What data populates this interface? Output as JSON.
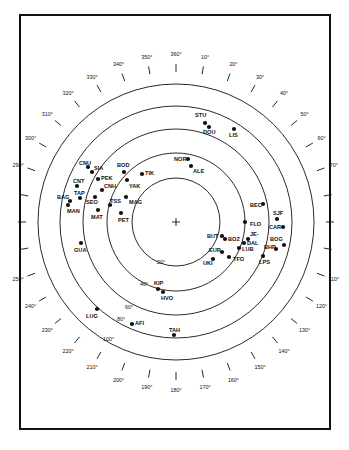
{
  "diagram": {
    "type": "polar-sky-plot",
    "center": [
      176,
      222
    ],
    "center_marker": "+",
    "rings": [
      {
        "label": "20°",
        "radius": 44
      },
      {
        "label": "40°",
        "radius": 69
      },
      {
        "label": "60°",
        "radius": 93
      },
      {
        "label": "80°",
        "radius": 116
      },
      {
        "label": "100°",
        "radius": 138
      }
    ],
    "azimuth_labels": [
      "360°",
      "10°",
      "20°",
      "30°",
      "40°",
      "50°",
      "60°",
      "70°",
      "",
      "",
      "",
      "110°",
      "120°",
      "130°",
      "140°",
      "150°",
      "160°",
      "170°",
      "180°",
      "190°",
      "200°",
      "210°",
      "220°",
      "230°",
      "240°",
      "250°",
      "",
      "",
      "",
      "290°",
      "300°",
      "310°",
      "320°",
      "330°",
      "340°",
      "350°"
    ],
    "stations": [
      {
        "code": "STU",
        "x": 205,
        "y": 123,
        "lx": 195,
        "ly": 117
      },
      {
        "code": "DOU",
        "x": 209,
        "y": 127,
        "lx": 203,
        "ly": 134
      },
      {
        "code": "LIS",
        "x": 234,
        "y": 129,
        "lx": 229,
        "ly": 137
      },
      {
        "code": "NOR",
        "x": 188,
        "y": 159,
        "lx": 174,
        "ly": 161
      },
      {
        "code": "ALE",
        "x": 191,
        "y": 166,
        "lx": 193,
        "ly": 173
      },
      {
        "code": "CNU",
        "x": 88,
        "y": 167,
        "lx": 79,
        "ly": 165
      },
      {
        "code": "SIA",
        "x": 92,
        "y": 172,
        "lx": 94,
        "ly": 170
      },
      {
        "code": "BOD",
        "x": 124,
        "y": 172,
        "lx": 117,
        "ly": 167
      },
      {
        "code": "TIK",
        "x": 142,
        "y": 174,
        "lx": 145,
        "ly": 175
      },
      {
        "code": "PEK",
        "x": 98,
        "y": 179,
        "lx": 101,
        "ly": 180
      },
      {
        "code": "YAK",
        "x": 127,
        "y": 180,
        "lx": 129,
        "ly": 188
      },
      {
        "code": "CNT",
        "x": 77,
        "y": 186,
        "lx": 73,
        "ly": 183
      },
      {
        "code": "CNH",
        "x": 102,
        "y": 190,
        "lx": 104,
        "ly": 188
      },
      {
        "code": "TAP",
        "x": 80,
        "y": 198,
        "lx": 74,
        "ly": 195
      },
      {
        "code": "SEO",
        "x": 95,
        "y": 197,
        "lx": 86,
        "ly": 204
      },
      {
        "code": "MAG",
        "x": 126,
        "y": 197,
        "lx": 129,
        "ly": 204
      },
      {
        "code": "BAG",
        "x": 70,
        "y": 201,
        "lx": 57,
        "ly": 199
      },
      {
        "code": "MAN",
        "x": 68,
        "y": 205,
        "lx": 67,
        "ly": 213
      },
      {
        "code": "TSS",
        "x": 110,
        "y": 205,
        "lx": 110,
        "ly": 203
      },
      {
        "code": "MAT",
        "x": 98,
        "y": 210,
        "lx": 91,
        "ly": 219
      },
      {
        "code": "PET",
        "x": 121,
        "y": 213,
        "lx": 118,
        "ly": 222
      },
      {
        "code": "BEC",
        "x": 263,
        "y": 204,
        "lx": 250,
        "ly": 207
      },
      {
        "code": "SJF",
        "x": 277,
        "y": 219,
        "lx": 273,
        "ly": 215
      },
      {
        "code": "FLO",
        "x": 245,
        "y": 222,
        "lx": 250,
        "ly": 226
      },
      {
        "code": "CAR",
        "x": 283,
        "y": 227,
        "lx": 269,
        "ly": 229
      },
      {
        "code": "BUT",
        "x": 222,
        "y": 236,
        "lx": 207,
        "ly": 238
      },
      {
        "code": "BOZ",
        "x": 225,
        "y": 239,
        "lx": 228,
        "ly": 241
      },
      {
        "code": "JE-",
        "x": 248,
        "y": 239,
        "lx": 250,
        "ly": 236
      },
      {
        "code": "DAL",
        "x": 244,
        "y": 243,
        "lx": 247,
        "ly": 245
      },
      {
        "code": "BOG",
        "x": 284,
        "y": 245,
        "lx": 270,
        "ly": 241
      },
      {
        "code": "LUB",
        "x": 239,
        "y": 248,
        "lx": 242,
        "ly": 251
      },
      {
        "code": "BHP",
        "x": 276,
        "y": 249,
        "lx": 264,
        "ly": 249
      },
      {
        "code": "EUR",
        "x": 222,
        "y": 252,
        "lx": 209,
        "ly": 252
      },
      {
        "code": "TFO",
        "x": 229,
        "y": 257,
        "lx": 233,
        "ly": 261
      },
      {
        "code": "LPS",
        "x": 263,
        "y": 256,
        "lx": 259,
        "ly": 264
      },
      {
        "code": "UKI",
        "x": 213,
        "y": 259,
        "lx": 203,
        "ly": 265
      },
      {
        "code": "GUA",
        "x": 81,
        "y": 243,
        "lx": 74,
        "ly": 252
      },
      {
        "code": "KIP",
        "x": 158,
        "y": 289,
        "lx": 154,
        "ly": 285
      },
      {
        "code": "HVO",
        "x": 163,
        "y": 292,
        "lx": 161,
        "ly": 300
      },
      {
        "code": "LUG",
        "x": 97,
        "y": 309,
        "lx": 86,
        "ly": 318
      },
      {
        "code": "AFI",
        "x": 132,
        "y": 324,
        "lx": 135,
        "ly": 325
      },
      {
        "code": "TAH",
        "x": 174,
        "y": 335,
        "lx": 169,
        "ly": 332
      }
    ]
  }
}
